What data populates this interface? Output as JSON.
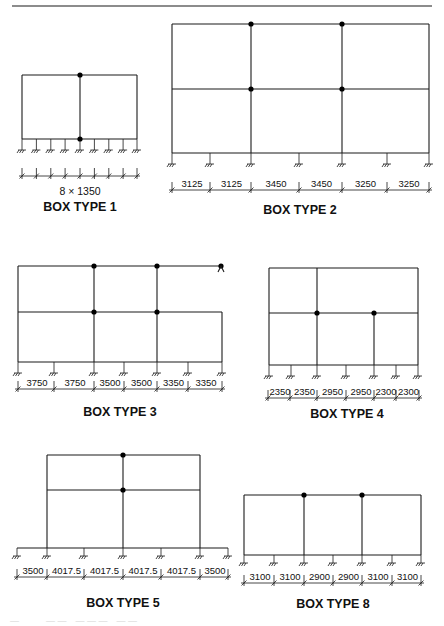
{
  "figure": {
    "top_rule": {
      "x1": 12,
      "x2": 432,
      "y": 6
    },
    "caption": "Figure ... (partially visible, cut off)"
  },
  "boxes": [
    {
      "id": "box1",
      "title": "BOX TYPE 1",
      "title_pos": [
        80,
        211
      ],
      "span_label": "8 × 1350",
      "span_label_pos": [
        80,
        195
      ],
      "frame": {
        "x": [
          22,
          137
        ],
        "levels": [
          75,
          139
        ]
      },
      "beams": [
        {
          "y": 75,
          "x1": 22,
          "x2": 137
        },
        {
          "y": 139,
          "x1": 22,
          "x2": 137
        }
      ],
      "columns": [
        {
          "x": 22,
          "y1": 75,
          "y2": 139
        },
        {
          "x": 80,
          "y1": 75,
          "y2": 139
        },
        {
          "x": 137,
          "y1": 75,
          "y2": 139
        }
      ],
      "nodes": [
        [
          80,
          75
        ],
        [
          80,
          139
        ]
      ],
      "supports_y": 139,
      "support_len": 11,
      "supports_x": [
        22,
        36.4,
        50.8,
        65.1,
        80,
        94.4,
        108.8,
        123.1,
        137
      ],
      "dims": {
        "y": 176,
        "ticks": [
          22,
          36.4,
          50.8,
          65.1,
          80,
          94.4,
          108.8,
          123.1,
          137
        ],
        "labels": []
      }
    },
    {
      "id": "box2",
      "title": "BOX TYPE 2",
      "title_pos": [
        300,
        214
      ],
      "frame": {
        "x": [
          172,
          429
        ],
        "levels": [
          24,
          89,
          153
        ]
      },
      "beams": [
        {
          "y": 24,
          "x1": 172,
          "x2": 429
        },
        {
          "y": 89,
          "x1": 172,
          "x2": 429
        },
        {
          "y": 153,
          "x1": 172,
          "x2": 429
        }
      ],
      "columns": [
        {
          "x": 172,
          "y1": 24,
          "y2": 153
        },
        {
          "x": 251,
          "y1": 24,
          "y2": 153
        },
        {
          "x": 342,
          "y1": 24,
          "y2": 153
        },
        {
          "x": 429,
          "y1": 24,
          "y2": 153
        }
      ],
      "nodes": [
        [
          251,
          24
        ],
        [
          342,
          24
        ],
        [
          251,
          89
        ],
        [
          342,
          89
        ]
      ],
      "supports_y": 153,
      "support_len": 11,
      "supports_x": [
        172,
        210,
        251,
        299,
        342,
        387,
        429
      ],
      "dims": {
        "y": 190,
        "ticks": [
          172,
          210,
          251,
          299,
          342,
          387,
          429
        ],
        "labels": [
          "3125",
          "3125",
          "3450",
          "3450",
          "3250",
          "3250"
        ]
      }
    },
    {
      "id": "box3",
      "title": "BOX TYPE 3",
      "title_pos": [
        120,
        416
      ],
      "frame": {
        "x": [
          18,
          222
        ],
        "levels": [
          266,
          312,
          362
        ]
      },
      "beams": [
        {
          "y": 266,
          "x1": 18,
          "x2": 222
        },
        {
          "y": 312,
          "x1": 18,
          "x2": 222
        },
        {
          "y": 362,
          "x1": 18,
          "x2": 222
        }
      ],
      "columns": [
        {
          "x": 18,
          "y1": 266,
          "y2": 362
        },
        {
          "x": 94,
          "y1": 266,
          "y2": 362
        },
        {
          "x": 157,
          "y1": 266,
          "y2": 362
        },
        {
          "x": 222,
          "y1": 312,
          "y2": 362
        }
      ],
      "nodes": [
        [
          94,
          266
        ],
        [
          157,
          266
        ],
        [
          94,
          312
        ],
        [
          157,
          312
        ],
        [
          221,
          266
        ]
      ],
      "pin_support": {
        "x": 221,
        "y": 266
      },
      "supports_y": 362,
      "support_len": 11,
      "supports_x": [
        18,
        54,
        94,
        124,
        157,
        188,
        222
      ],
      "dims": {
        "y": 389,
        "ticks": [
          18,
          54,
          94,
          124,
          157,
          188,
          222
        ],
        "labels": [
          "3750",
          "3750",
          "3500",
          "3500",
          "3350",
          "3350"
        ]
      }
    },
    {
      "id": "box4",
      "title": "BOX TYPE 4",
      "title_pos": [
        347,
        418
      ],
      "frame": {
        "x": [
          269,
          418
        ],
        "levels": [
          268,
          313,
          365
        ]
      },
      "beams": [
        {
          "y": 268,
          "x1": 269,
          "x2": 418
        },
        {
          "y": 313,
          "x1": 269,
          "x2": 418
        },
        {
          "y": 365,
          "x1": 269,
          "x2": 418
        }
      ],
      "columns": [
        {
          "x": 269,
          "y1": 268,
          "y2": 365
        },
        {
          "x": 317,
          "y1": 268,
          "y2": 365
        },
        {
          "x": 374,
          "y1": 313,
          "y2": 365
        },
        {
          "x": 418,
          "y1": 268,
          "y2": 365
        }
      ],
      "nodes": [
        [
          317,
          313
        ],
        [
          374,
          313
        ]
      ],
      "supports_y": 365,
      "support_len": 11,
      "supports_x": [
        269,
        291,
        317,
        346,
        374,
        396,
        418
      ],
      "dims": {
        "y": 398,
        "ticks": [
          268,
          290,
          317,
          346,
          374,
          396,
          419
        ],
        "labels": [
          "2350",
          "2350",
          "2950",
          "2950",
          "2300",
          "2300"
        ]
      }
    },
    {
      "id": "box5",
      "title": "BOX TYPE 5",
      "title_pos": [
        123,
        607
      ],
      "frame": {
        "x": [
          47,
          200
        ],
        "levels": [
          455,
          490,
          548
        ]
      },
      "beams": [
        {
          "y": 455,
          "x1": 47,
          "x2": 200
        },
        {
          "y": 490,
          "x1": 47,
          "x2": 200
        },
        {
          "y": 548,
          "x1": 17,
          "x2": 228
        }
      ],
      "columns": [
        {
          "x": 47,
          "y1": 455,
          "y2": 548
        },
        {
          "x": 123,
          "y1": 455,
          "y2": 548
        },
        {
          "x": 200,
          "y1": 455,
          "y2": 548
        }
      ],
      "nodes": [
        [
          123,
          455
        ],
        [
          123,
          490
        ]
      ],
      "supports_y": 548,
      "support_len": 8,
      "supports_x": [
        17,
        47,
        84,
        123,
        161,
        200,
        228
      ],
      "dims": {
        "y": 577,
        "ticks": [
          17,
          47,
          84,
          123,
          161,
          200,
          228
        ],
        "labels": [
          "3500",
          "4017.5",
          "4017.5",
          "4017.5",
          "4017.5",
          "3500"
        ]
      }
    },
    {
      "id": "box8",
      "title": "BOX TYPE 8",
      "title_pos": [
        333,
        608
      ],
      "frame": {
        "x": [
          244,
          421
        ],
        "levels": [
          495,
          555
        ]
      },
      "beams": [
        {
          "y": 495,
          "x1": 244,
          "x2": 421
        },
        {
          "y": 555,
          "x1": 244,
          "x2": 421
        }
      ],
      "columns": [
        {
          "x": 244,
          "y1": 495,
          "y2": 555
        },
        {
          "x": 304,
          "y1": 495,
          "y2": 555
        },
        {
          "x": 362,
          "y1": 495,
          "y2": 555
        },
        {
          "x": 421,
          "y1": 495,
          "y2": 555
        }
      ],
      "nodes": [
        [
          304,
          495
        ],
        [
          362,
          495
        ]
      ],
      "supports_y": 555,
      "support_len": 8,
      "supports_x": [
        244,
        274,
        304,
        333,
        362,
        392,
        421
      ],
      "dims": {
        "y": 583,
        "ticks": [
          244,
          274,
          304,
          333,
          362,
          392,
          421
        ],
        "labels": [
          "3100",
          "3100",
          "2900",
          "2900",
          "3100",
          "3100"
        ]
      }
    }
  ]
}
